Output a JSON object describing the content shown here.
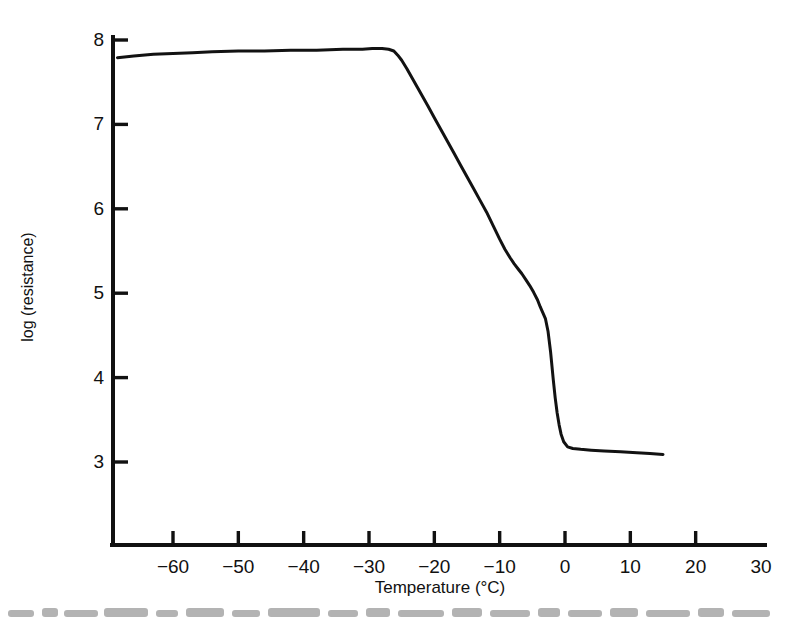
{
  "chart_data": {
    "type": "line",
    "title": "",
    "subtitle": "",
    "xlabel": "Temperature (°C)",
    "ylabel": "log (resistance)",
    "xlim": [
      -68.5,
      30
    ],
    "ylim": [
      2.55,
      8.1
    ],
    "grid": false,
    "legend": null,
    "xticks": [
      -60,
      -50,
      -40,
      -30,
      -20,
      -10,
      0,
      10,
      20,
      30
    ],
    "xtick_labels": [
      "−60",
      "−50",
      "−40",
      "−30",
      "−20",
      "−10",
      "0",
      "10",
      "20",
      "30"
    ],
    "yticks": [
      3,
      4,
      5,
      6,
      7,
      8
    ],
    "ytick_labels": [
      "3",
      "4",
      "5",
      "6",
      "7",
      "8"
    ],
    "series": [
      {
        "name": "log (resistance) vs Temperature",
        "color": "#121212",
        "linewidth": 3,
        "x": [
          -68.5,
          -66.0,
          -63.0,
          -60.0,
          -57.0,
          -54.0,
          -50.0,
          -46.0,
          -42.0,
          -38.0,
          -34.0,
          -31.0,
          -29.5,
          -28.0,
          -27.0,
          -26.2,
          -25.6,
          -25.0,
          -24.2,
          -23.4,
          -22.6,
          -21.8,
          -21.0,
          -20.0,
          -19.0,
          -18.0,
          -17.0,
          -16.0,
          -15.0,
          -14.0,
          -13.0,
          -12.0,
          -11.0,
          -10.0,
          -9.2,
          -8.4,
          -7.8,
          -7.2,
          -6.6,
          -6.0,
          -5.4,
          -4.8,
          -4.2,
          -3.8,
          -3.4,
          -3.0,
          -2.6,
          -2.2,
          -1.8,
          -1.5,
          -1.2,
          -0.9,
          -0.6,
          -0.2,
          0.4,
          1.2,
          2.4,
          4.0,
          6.0,
          8.5,
          11.0,
          13.0,
          15.0
        ],
        "y": [
          7.79,
          7.81,
          7.83,
          7.84,
          7.85,
          7.86,
          7.87,
          7.87,
          7.88,
          7.88,
          7.89,
          7.89,
          7.9,
          7.9,
          7.89,
          7.87,
          7.82,
          7.76,
          7.66,
          7.55,
          7.44,
          7.33,
          7.22,
          7.08,
          6.94,
          6.8,
          6.66,
          6.52,
          6.38,
          6.24,
          6.1,
          5.96,
          5.8,
          5.64,
          5.52,
          5.42,
          5.35,
          5.29,
          5.23,
          5.16,
          5.09,
          5.01,
          4.92,
          4.84,
          4.77,
          4.7,
          4.55,
          4.3,
          3.98,
          3.76,
          3.58,
          3.44,
          3.33,
          3.24,
          3.18,
          3.16,
          3.15,
          3.14,
          3.13,
          3.12,
          3.11,
          3.1,
          3.09
        ]
      }
    ],
    "notes": {
      "upper_plateau_value": 7.88,
      "lower_plateau_value": 3.1,
      "transition_onset_temp": -26,
      "transition_end_temp": -1,
      "shoulder_temp": -7,
      "shoulder_value": 5.4
    }
  },
  "axes": {
    "x_axis_name": "temperature-axis",
    "y_axis_name": "log-resistance-axis",
    "axis_color": "#111111"
  }
}
